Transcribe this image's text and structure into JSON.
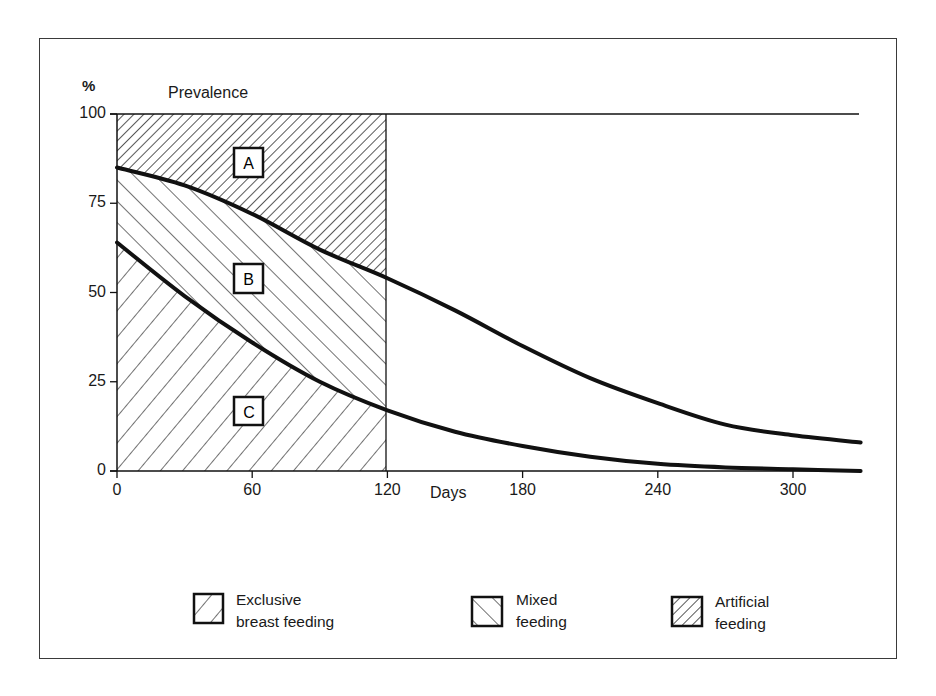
{
  "chart_data": {
    "type": "area",
    "title": "Prevalence",
    "ylabel": "%",
    "xlabel": "Days",
    "xlim": [
      0,
      330
    ],
    "ylim": [
      0,
      100
    ],
    "x_ticks": [
      0,
      60,
      120,
      180,
      240,
      300
    ],
    "y_ticks": [
      0,
      25,
      50,
      75,
      100
    ],
    "grid": false,
    "shaded_region_days": [
      0,
      120
    ],
    "x": [
      0,
      30,
      60,
      90,
      120,
      150,
      180,
      210,
      240,
      270,
      300,
      330
    ],
    "series": [
      {
        "name": "Any breast feeding (upper curve)",
        "values": [
          85,
          80,
          72,
          62,
          54,
          45,
          35,
          26,
          19,
          13,
          10,
          8
        ]
      },
      {
        "name": "Exclusive breast feeding (lower curve)",
        "values": [
          64,
          49,
          36,
          25,
          17,
          11,
          7,
          4,
          2,
          1,
          0.5,
          0
        ]
      }
    ],
    "regions": [
      {
        "label": "A",
        "meaning": "Artificial feeding",
        "between": "upper curve and 100%"
      },
      {
        "label": "B",
        "meaning": "Mixed feeding",
        "between": "lower curve and upper curve"
      },
      {
        "label": "C",
        "meaning": "Exclusive breast feeding",
        "between": "0 and lower curve"
      }
    ],
    "legend": [
      {
        "label": "Exclusive breast feeding",
        "pattern": "sparse-forward-hatch"
      },
      {
        "label": "Mixed feeding",
        "pattern": "back-hatch"
      },
      {
        "label": "Artificial feeding",
        "pattern": "dense-forward-hatch"
      }
    ],
    "legend_position": "bottom"
  },
  "labels": {
    "percent": "%",
    "title": "Prevalence",
    "xlabel": "Days",
    "region_a": "A",
    "region_b": "B",
    "region_c": "C"
  },
  "legend": {
    "exclusive": {
      "line1": "Exclusive",
      "line2": "breast feeding"
    },
    "mixed": {
      "line1": "Mixed",
      "line2": "feeding"
    },
    "artificial": {
      "line1": "Artificial",
      "line2": "feeding"
    }
  },
  "colors": {
    "ink": "#111111",
    "frame": "#3a3a3a",
    "background": "#ffffff"
  }
}
